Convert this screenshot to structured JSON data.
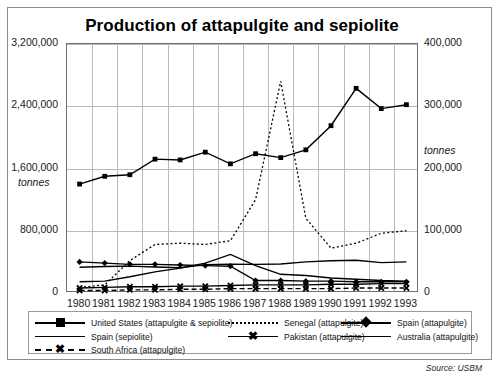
{
  "chart_data": {
    "type": "line",
    "title": "Production of attapulgite and sepiolite",
    "xlabel": "",
    "ylabel": "tonnes",
    "ylabel_right": "tonnes",
    "grid": true,
    "legend_position": "bottom",
    "source": "Source: USBM",
    "x": [
      1980,
      1981,
      1982,
      1983,
      1984,
      1985,
      1986,
      1987,
      1988,
      1989,
      1990,
      1991,
      1992,
      1993
    ],
    "categories": [
      "1980",
      "1981",
      "1982",
      "1983",
      "1984",
      "1985",
      "1986",
      "1987",
      "1988",
      "1989",
      "1990",
      "1991",
      "1992",
      "1993"
    ],
    "ylim": [
      0,
      3200000
    ],
    "yticks": [
      0,
      800000,
      1600000,
      2400000,
      3200000
    ],
    "ytick_labels": [
      "0",
      "800,000",
      "1,600,000",
      "2,400,000",
      "3,200,000"
    ],
    "ylim_right": [
      0,
      400000
    ],
    "yticks_right": [
      0,
      100000,
      200000,
      300000,
      400000
    ],
    "ytick_labels_right": [
      "0",
      "100,000",
      "200,000",
      "300,000",
      "400,000"
    ],
    "series": [
      {
        "name": "United States (attapulgite & sepiolite)",
        "axis": "left",
        "marker": "square",
        "line": "solid",
        "values": [
          1400000,
          1500000,
          1520000,
          1720000,
          1710000,
          1810000,
          1660000,
          1790000,
          1740000,
          1840000,
          2150000,
          2630000,
          2370000,
          2420000
        ]
      },
      {
        "name": "Spain (sepiolite)",
        "axis": "left",
        "marker": "none",
        "line": "solid",
        "values": [
          330000,
          340000,
          345000,
          335000,
          325000,
          365000,
          370000,
          368000,
          372000,
          400000,
          415000,
          420000,
          390000,
          400000
        ]
      },
      {
        "name": "Senegal (attapulgite)",
        "axis": "right",
        "marker": "none",
        "line": "dotted",
        "values": [
          9000,
          13000,
          52000,
          78000,
          80000,
          78000,
          84000,
          150000,
          340000,
          120000,
          72000,
          80000,
          96000,
          100000
        ]
      },
      {
        "name": "Pakistan (attapulgite)",
        "axis": "right",
        "marker": "x",
        "line": "solid",
        "values": [
          8000,
          9000,
          10000,
          10000,
          11000,
          11000,
          12000,
          13000,
          13000,
          13000,
          14000,
          14000,
          15000,
          15000
        ]
      },
      {
        "name": "Spain (attapulgite)",
        "axis": "right",
        "marker": "diamond",
        "line": "solid",
        "values": [
          50000,
          48000,
          46000,
          46000,
          45000,
          44000,
          43000,
          20000,
          20000,
          19000,
          19000,
          18000,
          18000,
          18000
        ]
      },
      {
        "name": "Australia (attapulgite)",
        "axis": "right",
        "marker": "none",
        "line": "solid",
        "values": [
          18000,
          19000,
          26000,
          34000,
          40000,
          48000,
          62000,
          44000,
          30000,
          28000,
          24000,
          22000,
          20000,
          19000
        ]
      },
      {
        "name": "South Africa (attapulgite)",
        "axis": "right",
        "marker": "x",
        "line": "dashed",
        "values": [
          4000,
          4000,
          5000,
          5000,
          6000,
          6000,
          7000,
          7000,
          7000,
          7000,
          7000,
          8000,
          8000,
          8000
        ]
      }
    ]
  },
  "legend": {
    "rows": [
      [
        {
          "label": "United States (attapulgite & sepiolite)",
          "style": "solid",
          "marker": "square"
        },
        {
          "label": "Senegal (attapulgite)",
          "style": "dotted",
          "marker": "none"
        },
        {
          "label": "Spain (attapulgite)",
          "style": "solid",
          "marker": "diamond"
        }
      ],
      [
        {
          "label": "Spain (sepiolite)",
          "style": "solid",
          "marker": "none"
        },
        {
          "label": "Pakistan (attapulgite)",
          "style": "solid",
          "marker": "x"
        },
        {
          "label": "Australia (attapulgite)",
          "style": "solid",
          "marker": "none"
        }
      ],
      [
        {
          "label": "South Africa (attapulgite)",
          "style": "dashed",
          "marker": "x"
        }
      ]
    ]
  },
  "colors": {
    "ink": "#000000",
    "grid": "#b9b9b9",
    "frame": "#8d8d8d"
  }
}
